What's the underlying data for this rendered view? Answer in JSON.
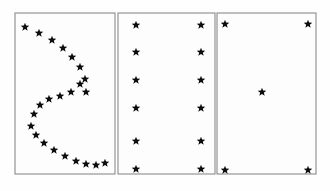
{
  "figure": {
    "background_color": "#fefefe",
    "border_color": "#8a8a8a",
    "star_color": "#0d0d0d",
    "canvas": {
      "width": 330,
      "height": 191
    }
  },
  "chart_data": {
    "type": "scatter",
    "xlabel": "",
    "ylabel": "",
    "grid": false,
    "legend": null,
    "marker": "star",
    "axis_ranges": {
      "xlim": [
        0,
        330
      ],
      "ylim": [
        0,
        191
      ]
    },
    "panels": [
      {
        "name": "panel-left-crescent",
        "label": "",
        "bounds": {
          "x": 15,
          "y": 13,
          "width": 100,
          "height": 161
        },
        "point_count": 23,
        "description": "Crescent / C-shaped arc of stars opening toward the right",
        "points": [
          {
            "x": 25,
            "y": 27
          },
          {
            "x": 39,
            "y": 33
          },
          {
            "x": 52,
            "y": 40
          },
          {
            "x": 63,
            "y": 48
          },
          {
            "x": 72,
            "y": 57
          },
          {
            "x": 80,
            "y": 67
          },
          {
            "x": 85,
            "y": 79
          },
          {
            "x": 86,
            "y": 92
          },
          {
            "x": 80,
            "y": 84
          },
          {
            "x": 71,
            "y": 92
          },
          {
            "x": 60,
            "y": 96
          },
          {
            "x": 49,
            "y": 99
          },
          {
            "x": 40,
            "y": 105
          },
          {
            "x": 34,
            "y": 114
          },
          {
            "x": 31,
            "y": 126
          },
          {
            "x": 36,
            "y": 135
          },
          {
            "x": 44,
            "y": 143
          },
          {
            "x": 54,
            "y": 150
          },
          {
            "x": 65,
            "y": 156
          },
          {
            "x": 76,
            "y": 161
          },
          {
            "x": 86,
            "y": 164
          },
          {
            "x": 96,
            "y": 165
          },
          {
            "x": 105,
            "y": 163
          }
        ]
      },
      {
        "name": "panel-middle-columns",
        "label": "",
        "bounds": {
          "x": 118,
          "y": 13,
          "width": 97,
          "height": 161
        },
        "point_count": 12,
        "description": "Two evenly spaced vertical columns of six stars each",
        "points": [
          {
            "x": 136,
            "y": 25
          },
          {
            "x": 136,
            "y": 52
          },
          {
            "x": 136,
            "y": 80
          },
          {
            "x": 136,
            "y": 108
          },
          {
            "x": 136,
            "y": 141
          },
          {
            "x": 136,
            "y": 169
          },
          {
            "x": 201,
            "y": 25
          },
          {
            "x": 201,
            "y": 52
          },
          {
            "x": 201,
            "y": 80
          },
          {
            "x": 201,
            "y": 108
          },
          {
            "x": 201,
            "y": 141
          },
          {
            "x": 201,
            "y": 169
          }
        ]
      },
      {
        "name": "panel-right-corners",
        "label": "",
        "bounds": {
          "x": 217,
          "y": 13,
          "width": 99,
          "height": 161
        },
        "point_count": 5,
        "description": "Four corner stars plus one offset central star",
        "points": [
          {
            "x": 225,
            "y": 24
          },
          {
            "x": 308,
            "y": 24
          },
          {
            "x": 262,
            "y": 92
          },
          {
            "x": 225,
            "y": 170
          },
          {
            "x": 308,
            "y": 170
          }
        ]
      }
    ]
  }
}
